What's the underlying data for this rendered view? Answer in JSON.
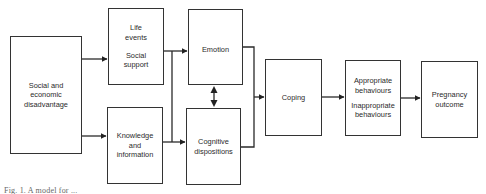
{
  "diagram": {
    "nodes": {
      "social_economic": {
        "label": "Social and\neconomic\ndisadvantage"
      },
      "life_events": {
        "label_1": "Life\nevents",
        "label_2": "Social\nsupport"
      },
      "knowledge": {
        "label": "Knowledge\nand\ninformation"
      },
      "emotion": {
        "label": "Emotion"
      },
      "cognitive": {
        "label": "Cognitive\ndispositions"
      },
      "coping": {
        "label": "Coping"
      },
      "behaviours": {
        "label_1": "Appropriate\nbehaviours",
        "label_2": "Inappropriate\nbehaviours"
      },
      "pregnancy": {
        "label": "Pregnancy\noutcome"
      }
    },
    "edges": [
      {
        "from": "Social and economic disadvantage",
        "to": "Life events / Social support"
      },
      {
        "from": "Social and economic disadvantage",
        "to": "Knowledge and information"
      },
      {
        "from": "Life events / Social support",
        "to": "Emotion"
      },
      {
        "from": "Knowledge and information",
        "to": "Cognitive dispositions"
      },
      {
        "from": "Life events / Social support",
        "to": "Cognitive dispositions",
        "via": "shared vertical connector"
      },
      {
        "from": "Emotion",
        "to": "Cognitive dispositions",
        "bidirectional": true
      },
      {
        "from": "Emotion",
        "to": "Coping"
      },
      {
        "from": "Cognitive dispositions",
        "to": "Coping"
      },
      {
        "from": "Coping",
        "to": "Appropriate / Inappropriate behaviours"
      },
      {
        "from": "Appropriate / Inappropriate behaviours",
        "to": "Pregnancy outcome"
      }
    ],
    "colors": {
      "line": "#333333",
      "text": "#2a2a2a",
      "background": "#ffffff"
    }
  },
  "caption": "Fig. 1. A model for ..."
}
